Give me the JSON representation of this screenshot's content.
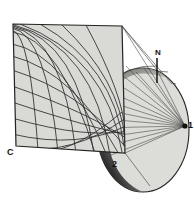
{
  "figure": {
    "type": "technical-line-diagram"
  },
  "labels": {
    "plane_corner": "C",
    "projection_point": "1",
    "tangent_point": "2",
    "north_pole": "N"
  },
  "colors": {
    "plane_fill": "#d9d9d6",
    "sphere_fill": "#dcdcd9",
    "shadow_dark": "#1a1a1a",
    "line": "#2a2a2a",
    "ray": "#3a3a3a",
    "background": "#ffffff"
  },
  "geometry": {
    "plane_corners": [
      [
        13,
        24
      ],
      [
        122,
        26
      ],
      [
        125,
        153
      ],
      [
        16,
        146
      ]
    ],
    "projection_apex": [
      185,
      126
    ],
    "sphere_center": [
      143,
      130
    ],
    "sphere_rx": 46,
    "sphere_ry": 62,
    "north_pole_marker": [
      157,
      56
    ],
    "tangent_point": [
      111,
      157
    ]
  },
  "elements": {
    "grid": "curvilinear-stereographic-net",
    "meridian_count": 9,
    "parallel_count": 8,
    "ray_count": 14
  }
}
